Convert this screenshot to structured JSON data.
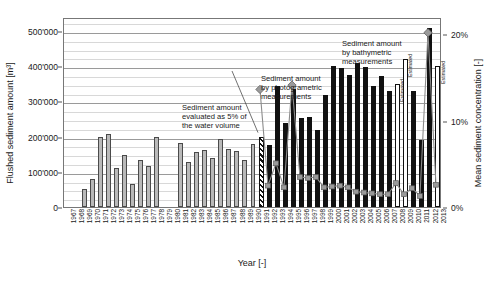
{
  "chart_data": {
    "type": "bar",
    "title": "",
    "xlabel": "Year [-]",
    "ylabel": "Flushed sediment amount [m³]",
    "y2label": "Mean sediment concentration [-]",
    "ylim": [
      0,
      540000
    ],
    "y2lim": [
      0,
      22
    ],
    "grid": true,
    "legend_position": "none",
    "yticks": [
      "0",
      "100'000",
      "200'000",
      "300'000",
      "400'000",
      "500'000"
    ],
    "ytick_values": [
      0,
      100000,
      200000,
      300000,
      400000,
      500000
    ],
    "y2ticks": [
      "0%",
      "10%",
      "20%"
    ],
    "y2tick_values": [
      0,
      10,
      20
    ],
    "categories": [
      "1967",
      "1968",
      "1969",
      "1970",
      "1971",
      "1972",
      "1973",
      "1974",
      "1975",
      "1976",
      "1977",
      "1978",
      "1979",
      "1980",
      "1981",
      "1982",
      "1983",
      "1984",
      "1985",
      "1986",
      "1987",
      "1988",
      "1989",
      "1990",
      "1991",
      "1992",
      "1993",
      "1994",
      "1995",
      "1996",
      "1997",
      "1998",
      "1999",
      "2000",
      "2001",
      "2002",
      "2003",
      "2004",
      "2005",
      "2006",
      "2007",
      "2008",
      "2009",
      "2010",
      "2011",
      "2012",
      "2013"
    ],
    "series": [
      {
        "name": "Flushed sediment amount",
        "unit": "m³",
        "axis": "left",
        "values": [
          null,
          null,
          51000,
          81000,
          199000,
          208000,
          110000,
          148000,
          66000,
          135000,
          116000,
          200000,
          null,
          null,
          181000,
          128000,
          156000,
          162000,
          140000,
          192000,
          166000,
          158000,
          133000,
          178000,
          200000,
          175000,
          345000,
          238000,
          334000,
          252000,
          256000,
          218000,
          318000,
          400000,
          394000,
          374000,
          408000,
          399000,
          345000,
          372000,
          330000,
          350000,
          420000,
          330000,
          190000,
          510000,
          400000
        ],
        "styles": [
          "none",
          "none",
          "dotted",
          "dotted",
          "dotted",
          "dotted",
          "dotted",
          "dotted",
          "dotted",
          "dotted",
          "dotted",
          "dotted",
          "none",
          "none",
          "dotted",
          "dotted",
          "dotted",
          "dotted",
          "dotted",
          "dotted",
          "dotted",
          "dotted",
          "dotted",
          "dotted",
          "hatch",
          "black",
          "black",
          "black",
          "black",
          "black",
          "black",
          "black",
          "black",
          "black",
          "black",
          "black",
          "black",
          "black",
          "black",
          "black",
          "black",
          "white",
          "white",
          "black",
          "black",
          "black",
          "white"
        ]
      },
      {
        "name": "Mean sediment concentration",
        "unit": "%",
        "axis": "right",
        "values": [
          null,
          null,
          null,
          null,
          null,
          null,
          null,
          null,
          null,
          null,
          null,
          null,
          null,
          null,
          null,
          null,
          null,
          null,
          null,
          null,
          null,
          null,
          null,
          null,
          13.8,
          2.6,
          5.2,
          2.4,
          14.3,
          3.6,
          3.5,
          3.6,
          2.4,
          2.5,
          2.6,
          2.4,
          1.9,
          1.8,
          1.7,
          1.6,
          1.6,
          2.9,
          1.6,
          2.3,
          1.4,
          20.4,
          2.7
        ]
      }
    ],
    "marker_highlight_years": [
      "1991",
      "1995",
      "2012"
    ],
    "bar_legend": {
      "dotted": "Sediment amount evaluated as 5% of the water volume",
      "hatch": "Sediment amount by photogrametric measurements",
      "black": "Sediment amount by bathymetric measurements",
      "white": "Estimated"
    }
  },
  "axes": {
    "y_left_title": "Flushed sediment amount [m³]",
    "y_right_title": "Mean sediment concentration [-]",
    "x_title": "Year [-]"
  },
  "annotations": {
    "a": "Sediment amount\nevaluated as 5% of\nthe water volume",
    "b": "Sediment amount\nby photogrametric\nmeasurements",
    "c": "Sediment amount\nby bathymetric\nmeasurements",
    "estimated_label": "Estimated"
  },
  "colors": {
    "bar_black": "#111111",
    "bar_dotted_fill": "#b9b9b9",
    "bar_white_fill": "#ffffff",
    "line": "#8c8c8c",
    "marker": "#9a9a9a",
    "grid_minor": "#d8d8d8",
    "grid_major": "#9a9a9a",
    "text": "#1a1a1a"
  }
}
